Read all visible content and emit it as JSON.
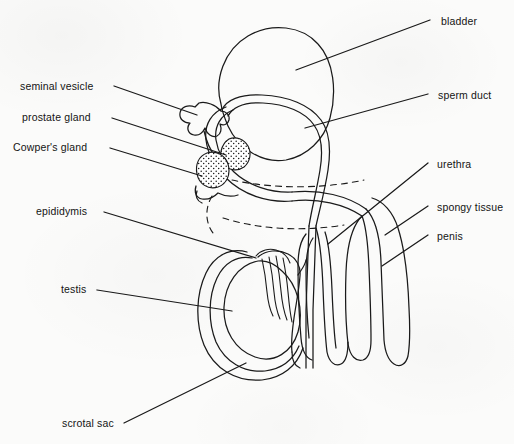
{
  "figure": {
    "type": "anatomical-diagram",
    "style": "line-drawing",
    "background_color": "#fbfbfa",
    "line_color": "#1a1a1a"
  },
  "labels_left": [
    {
      "id": "seminal-vesicle",
      "text": "seminal vesicle",
      "x": 20,
      "y": 88
    },
    {
      "id": "prostate-gland",
      "text": "prostate gland",
      "x": 22,
      "y": 119
    },
    {
      "id": "cowpers-gland",
      "text": "Cowper's gland",
      "x": 13,
      "y": 148
    },
    {
      "id": "epididymis",
      "text": "epididymis",
      "x": 36,
      "y": 212
    },
    {
      "id": "testis",
      "text": "testis",
      "x": 61,
      "y": 290
    },
    {
      "id": "scrotal-sac",
      "text": "scrotal sac",
      "x": 62,
      "y": 424
    }
  ],
  "labels_right": [
    {
      "id": "bladder",
      "text": "bladder",
      "x": 441,
      "y": 22
    },
    {
      "id": "sperm-duct",
      "text": "sperm duct",
      "x": 438,
      "y": 96
    },
    {
      "id": "urethra",
      "text": "urethra",
      "x": 437,
      "y": 165
    },
    {
      "id": "spongy-tissue",
      "text": "spongy tissue",
      "x": 437,
      "y": 208
    },
    {
      "id": "penis",
      "text": "penis",
      "x": 437,
      "y": 237
    }
  ],
  "parts": [
    "bladder",
    "sperm duct",
    "urethra",
    "spongy tissue",
    "penis",
    "seminal vesicle",
    "prostate gland",
    "Cowper's gland",
    "epididymis",
    "testis",
    "scrotal sac"
  ]
}
